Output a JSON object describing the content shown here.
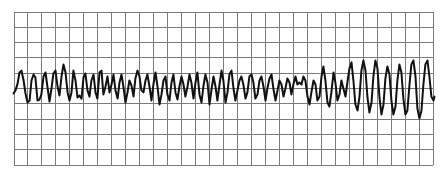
{
  "chart_data": {
    "type": "line",
    "title": "",
    "xlabel": "",
    "ylabel": "",
    "grid": true,
    "grid_columns": 30,
    "grid_rows": 10,
    "xlim": [
      0,
      30
    ],
    "ylim": [
      0,
      10
    ],
    "y_axis_direction": "down",
    "legend": "none",
    "colors": {
      "grid": "#7a7a7a",
      "trace": "#111111",
      "background": "#ffffff"
    },
    "series": [
      {
        "name": "trace",
        "points": [
          [
            0.0,
            5.36
          ],
          [
            0.14,
            5.16
          ],
          [
            0.29,
            4.71
          ],
          [
            0.43,
            3.99
          ],
          [
            0.57,
            3.86
          ],
          [
            0.72,
            4.51
          ],
          [
            0.86,
            5.36
          ],
          [
            1.0,
            5.95
          ],
          [
            1.15,
            5.82
          ],
          [
            1.29,
            4.51
          ],
          [
            1.43,
            4.12
          ],
          [
            1.57,
            4.31
          ],
          [
            1.72,
            5.82
          ],
          [
            1.86,
            5.75
          ],
          [
            2.0,
            5.42
          ],
          [
            2.15,
            4.25
          ],
          [
            2.29,
            3.99
          ],
          [
            2.43,
            4.9
          ],
          [
            2.58,
            5.88
          ],
          [
            2.72,
            5.03
          ],
          [
            2.86,
            4.05
          ],
          [
            3.01,
            3.86
          ],
          [
            3.15,
            4.9
          ],
          [
            3.29,
            5.49
          ],
          [
            3.44,
            4.25
          ],
          [
            3.58,
            3.46
          ],
          [
            3.72,
            3.99
          ],
          [
            3.87,
            5.29
          ],
          [
            4.01,
            5.82
          ],
          [
            4.15,
            5.29
          ],
          [
            4.29,
            3.86
          ],
          [
            4.44,
            4.51
          ],
          [
            4.58,
            5.62
          ],
          [
            4.72,
            5.49
          ],
          [
            4.87,
            5.69
          ],
          [
            5.01,
            4.31
          ],
          [
            5.15,
            4.05
          ],
          [
            5.3,
            5.16
          ],
          [
            5.44,
            5.56
          ],
          [
            5.58,
            4.51
          ],
          [
            5.73,
            4.12
          ],
          [
            5.87,
            5.29
          ],
          [
            6.01,
            5.69
          ],
          [
            6.16,
            3.99
          ],
          [
            6.3,
            3.86
          ],
          [
            6.44,
            5.42
          ],
          [
            6.59,
            4.9
          ],
          [
            6.73,
            4.25
          ],
          [
            6.87,
            5.29
          ],
          [
            7.02,
            4.77
          ],
          [
            7.16,
            4.12
          ],
          [
            7.3,
            5.16
          ],
          [
            7.45,
            5.69
          ],
          [
            7.59,
            4.64
          ],
          [
            7.73,
            4.12
          ],
          [
            7.87,
            4.9
          ],
          [
            8.02,
            5.95
          ],
          [
            8.16,
            5.29
          ],
          [
            8.3,
            4.51
          ],
          [
            8.45,
            4.84
          ],
          [
            8.59,
            5.56
          ],
          [
            8.73,
            4.38
          ],
          [
            8.88,
            3.86
          ],
          [
            9.02,
            4.25
          ],
          [
            9.16,
            5.16
          ],
          [
            9.31,
            5.29
          ],
          [
            9.45,
            4.51
          ],
          [
            9.59,
            4.12
          ],
          [
            9.74,
            4.9
          ],
          [
            9.88,
            5.82
          ],
          [
            10.02,
            4.77
          ],
          [
            10.17,
            3.99
          ],
          [
            10.31,
            4.9
          ],
          [
            10.45,
            6.08
          ],
          [
            10.6,
            5.42
          ],
          [
            10.74,
            4.51
          ],
          [
            10.88,
            4.25
          ],
          [
            11.02,
            5.42
          ],
          [
            11.17,
            5.82
          ],
          [
            11.31,
            4.64
          ],
          [
            11.45,
            4.12
          ],
          [
            11.6,
            5.29
          ],
          [
            11.74,
            5.75
          ],
          [
            11.88,
            4.9
          ],
          [
            12.03,
            4.25
          ],
          [
            12.17,
            4.77
          ],
          [
            12.31,
            5.56
          ],
          [
            12.46,
            4.9
          ],
          [
            12.6,
            4.12
          ],
          [
            12.74,
            4.64
          ],
          [
            12.89,
            5.69
          ],
          [
            13.03,
            4.64
          ],
          [
            13.17,
            3.99
          ],
          [
            13.32,
            5.42
          ],
          [
            13.46,
            5.95
          ],
          [
            13.6,
            4.9
          ],
          [
            13.74,
            4.12
          ],
          [
            13.89,
            4.64
          ],
          [
            14.03,
            6.08
          ],
          [
            14.17,
            5.16
          ],
          [
            14.32,
            4.25
          ],
          [
            14.46,
            4.9
          ],
          [
            14.6,
            5.82
          ],
          [
            14.75,
            4.77
          ],
          [
            14.89,
            3.86
          ],
          [
            15.03,
            4.51
          ],
          [
            15.18,
            5.95
          ],
          [
            15.32,
            5.29
          ],
          [
            15.46,
            4.12
          ],
          [
            15.61,
            3.86
          ],
          [
            15.75,
            5.03
          ],
          [
            15.89,
            5.82
          ],
          [
            16.04,
            5.16
          ],
          [
            16.18,
            4.51
          ],
          [
            16.32,
            4.25
          ],
          [
            16.46,
            4.77
          ],
          [
            16.61,
            5.69
          ],
          [
            16.75,
            5.29
          ],
          [
            16.89,
            4.25
          ],
          [
            17.04,
            4.12
          ],
          [
            17.18,
            4.64
          ],
          [
            17.32,
            5.69
          ],
          [
            17.47,
            5.42
          ],
          [
            17.61,
            4.51
          ],
          [
            17.75,
            4.25
          ],
          [
            17.9,
            4.9
          ],
          [
            18.04,
            5.82
          ],
          [
            18.18,
            5.03
          ],
          [
            18.33,
            4.38
          ],
          [
            18.47,
            4.12
          ],
          [
            18.61,
            5.03
          ],
          [
            18.76,
            5.82
          ],
          [
            18.9,
            5.16
          ],
          [
            19.04,
            4.51
          ],
          [
            19.19,
            4.77
          ],
          [
            19.33,
            5.56
          ],
          [
            19.47,
            5.03
          ],
          [
            19.61,
            4.38
          ],
          [
            19.76,
            4.64
          ],
          [
            19.9,
            5.42
          ],
          [
            20.04,
            4.77
          ],
          [
            20.19,
            4.25
          ],
          [
            20.33,
            4.77
          ],
          [
            20.47,
            4.64
          ],
          [
            20.62,
            4.77
          ],
          [
            20.76,
            4.25
          ],
          [
            20.9,
            4.51
          ],
          [
            21.05,
            5.56
          ],
          [
            21.19,
            6.08
          ],
          [
            21.33,
            5.29
          ],
          [
            21.48,
            4.51
          ],
          [
            21.62,
            4.77
          ],
          [
            21.76,
            5.82
          ],
          [
            21.91,
            5.56
          ],
          [
            22.05,
            4.25
          ],
          [
            22.19,
            3.59
          ],
          [
            22.33,
            4.51
          ],
          [
            22.48,
            5.95
          ],
          [
            22.62,
            6.21
          ],
          [
            22.76,
            5.29
          ],
          [
            22.91,
            3.99
          ],
          [
            23.05,
            4.64
          ],
          [
            23.19,
            5.82
          ],
          [
            23.34,
            5.42
          ],
          [
            23.48,
            4.51
          ],
          [
            23.62,
            5.03
          ],
          [
            23.77,
            5.56
          ],
          [
            23.91,
            4.64
          ],
          [
            24.05,
            3.73
          ],
          [
            24.2,
            3.33
          ],
          [
            24.34,
            4.51
          ],
          [
            24.48,
            6.08
          ],
          [
            24.63,
            6.47
          ],
          [
            24.77,
            5.56
          ],
          [
            24.91,
            3.86
          ],
          [
            25.05,
            3.2
          ],
          [
            25.2,
            3.86
          ],
          [
            25.34,
            5.56
          ],
          [
            25.48,
            6.6
          ],
          [
            25.63,
            5.95
          ],
          [
            25.77,
            4.25
          ],
          [
            25.91,
            3.2
          ],
          [
            26.06,
            3.73
          ],
          [
            26.2,
            5.56
          ],
          [
            26.34,
            6.73
          ],
          [
            26.49,
            6.08
          ],
          [
            26.63,
            4.38
          ],
          [
            26.77,
            3.59
          ],
          [
            26.92,
            4.12
          ],
          [
            27.06,
            5.82
          ],
          [
            27.2,
            6.73
          ],
          [
            27.35,
            6.21
          ],
          [
            27.49,
            4.51
          ],
          [
            27.63,
            3.46
          ],
          [
            27.77,
            3.99
          ],
          [
            27.92,
            5.69
          ],
          [
            28.06,
            6.73
          ],
          [
            28.2,
            6.47
          ],
          [
            28.35,
            4.77
          ],
          [
            28.49,
            3.46
          ],
          [
            28.63,
            3.2
          ],
          [
            28.78,
            4.25
          ],
          [
            28.92,
            6.34
          ],
          [
            29.06,
            6.99
          ],
          [
            29.21,
            6.47
          ],
          [
            29.35,
            4.77
          ],
          [
            29.49,
            3.46
          ],
          [
            29.64,
            3.2
          ],
          [
            29.78,
            4.25
          ],
          [
            29.92,
            5.56
          ],
          [
            30.07,
            5.82
          ],
          [
            30.14,
            5.56
          ]
        ]
      }
    ]
  }
}
